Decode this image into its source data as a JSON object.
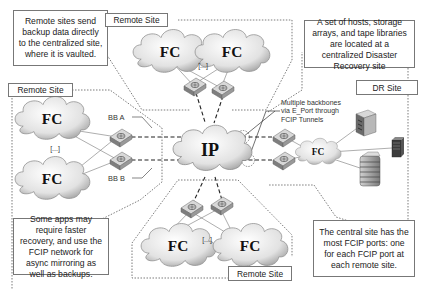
{
  "notes": {
    "top_left": "Remote sites send backup data directly to the centralized site, where it is vaulted.",
    "top_right": "A set of hosts, storage arrays, and tape libraries are located at a centralized Disaster Recovery site",
    "bottom_left": "Some apps may require faster recovery, and use the FCIP network for async mirroring as well as backups.",
    "bottom_right": "The central site has the most FCIP ports: one for each FCIP port at each remote site."
  },
  "sites": {
    "top": {
      "label": "Remote Site"
    },
    "left": {
      "label": "Remote Site"
    },
    "bottom": {
      "label": "Remote Site"
    },
    "dr": {
      "label": "DR Site"
    }
  },
  "clouds": {
    "fc": "FC",
    "ip": "IP",
    "ellipsis": "[...]"
  },
  "labels": {
    "bb_a": "BB A",
    "bb_b": "BB B",
    "callout": "Multiple backbones\nvia E_Port through\nFCIP Tunnels"
  },
  "colors": {
    "border": "#777777",
    "cloud_fill": "#e6e6e6",
    "switch_fill": "#9a9a9a",
    "dashed": "#444444"
  }
}
